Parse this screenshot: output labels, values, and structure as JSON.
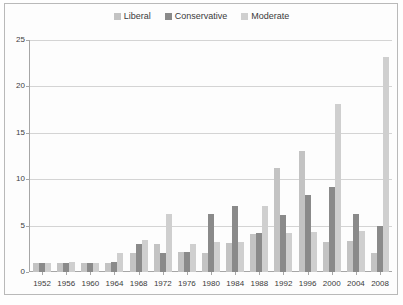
{
  "chart_data": {
    "type": "bar",
    "title": "",
    "subtitle": "",
    "xlabel": "",
    "ylabel": "",
    "categories": [
      "1952",
      "1956",
      "1960",
      "1964",
      "1968",
      "1972",
      "1976",
      "1980",
      "1984",
      "1988",
      "1992",
      "1996",
      "2000",
      "2004",
      "2008"
    ],
    "series": [
      {
        "name": "Liberal",
        "color": "#c3c3c3",
        "values": [
          1.0,
          1.0,
          1.0,
          1.0,
          2.0,
          3.0,
          2.2,
          2.0,
          3.1,
          4.1,
          11.2,
          13.0,
          3.2,
          3.3,
          2.0
        ]
      },
      {
        "name": "Conservative",
        "color": "#8a8a8a",
        "values": [
          1.0,
          1.0,
          1.0,
          1.1,
          3.0,
          2.1,
          2.2,
          6.2,
          7.1,
          4.2,
          6.1,
          8.3,
          9.2,
          6.2,
          5.0
        ]
      },
      {
        "name": "Moderate",
        "color": "#cfcfcf",
        "values": [
          1.0,
          1.1,
          1.0,
          2.0,
          3.5,
          6.2,
          3.0,
          3.2,
          3.2,
          7.1,
          4.2,
          4.3,
          18.1,
          4.4,
          23.2
        ]
      }
    ],
    "ylim": [
      0,
      25
    ],
    "yticks": [
      0,
      5,
      10,
      15,
      20,
      25
    ],
    "ytick_labels": [
      "0",
      "5",
      "10",
      "15",
      "20",
      "25"
    ],
    "grid": true,
    "legend_position": "top-center"
  },
  "legend": {
    "entries": [
      {
        "label": "Liberal"
      },
      {
        "label": "Conservative"
      },
      {
        "label": "Moderate"
      }
    ]
  }
}
